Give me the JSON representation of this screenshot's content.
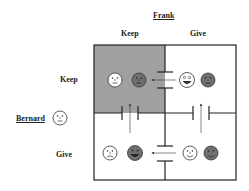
{
  "column_player": {
    "name": "Frank",
    "strategies": [
      "Keep",
      "Give"
    ]
  },
  "row_player": {
    "name": "Bernard",
    "strategies": [
      "Keep",
      "Give"
    ]
  },
  "colors": {
    "shaded_cell": "#a0a0a0",
    "border": "#222222",
    "dark_face": "#707070",
    "light_face": "#ffffff"
  },
  "cells": [
    {
      "row": "Keep",
      "col": "Keep",
      "shaded": true,
      "bernard_face": "neutral",
      "frank_face": "neutral"
    },
    {
      "row": "Keep",
      "col": "Give",
      "shaded": false,
      "bernard_face": "very-happy",
      "frank_face": "sad"
    },
    {
      "row": "Give",
      "col": "Keep",
      "shaded": false,
      "bernard_face": "sad",
      "frank_face": "very-happy"
    },
    {
      "row": "Give",
      "col": "Give",
      "shaded": false,
      "bernard_face": "happy",
      "frank_face": "happy"
    }
  ],
  "arrows": [
    {
      "from": "Keep/Give",
      "to": "Keep/Keep",
      "direction": "left"
    },
    {
      "from": "Give/Give",
      "to": "Give/Keep",
      "direction": "left"
    },
    {
      "from": "Give/Keep",
      "to": "Keep/Keep",
      "direction": "up"
    },
    {
      "from": "Give/Give",
      "to": "Keep/Give",
      "direction": "up"
    }
  ]
}
